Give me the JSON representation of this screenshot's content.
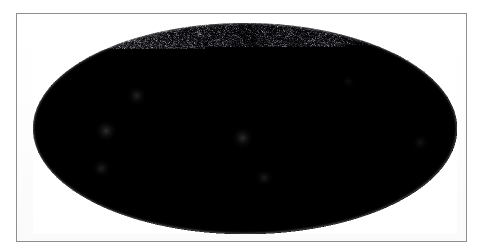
{
  "figure": {
    "title": "",
    "caption": "",
    "type": "all-sky-map",
    "projection": "Mollweide",
    "coordinate_system": "Galactic",
    "border_color": "#8e8e90",
    "page_background": "#ffffff",
    "frame_background": "#ffffff"
  },
  "skymap": {
    "name": "all-sky-galaxy-density-map",
    "shape": "ellipse",
    "center_x": 244,
    "center_y": 128,
    "semi_axis_x": 212,
    "semi_axis_y": 105,
    "background_color": "#000000",
    "speckle_color_dim": "#2a2a2c",
    "speckle_color_mid": "#8a8a8e",
    "speckle_color_bright": "#e8e8ef",
    "filament_color": "#b9b9c4",
    "galactic_plane_mask_color": "#050506",
    "label": "",
    "axes_visible": false,
    "gridlines_visible": false,
    "colorbar_visible": false,
    "legend_visible": false,
    "tick_labels": []
  },
  "chart_data": {
    "type": "heatmap",
    "title": "",
    "xlabel": "",
    "ylabel": "",
    "projection": "Mollweide",
    "grid": false,
    "legend": false,
    "colorbar": false,
    "xlim": [
      180,
      -180
    ],
    "ylim": [
      -90,
      90
    ],
    "structures": [
      {
        "name": "bright-cluster-left",
        "l": 118,
        "b": -2,
        "intensity": 0.92
      },
      {
        "name": "bright-cluster-left-upper",
        "l": 96,
        "b": 28,
        "intensity": 0.74
      },
      {
        "name": "filament-lower-left",
        "l": 130,
        "b": -34,
        "intensity": 0.66
      },
      {
        "name": "central-filament-knot",
        "l": 2,
        "b": -8,
        "intensity": 0.88
      },
      {
        "name": "galactic-plane-mask",
        "l": 0,
        "b": 0,
        "intensity": 0.05
      },
      {
        "name": "filament-lower-centre",
        "l": -18,
        "b": -42,
        "intensity": 0.58
      },
      {
        "name": "diffuse-region-upper-right",
        "l": -96,
        "b": 40,
        "intensity": 0.28
      },
      {
        "name": "filament-right-edge",
        "l": -150,
        "b": -12,
        "intensity": 0.45
      }
    ]
  }
}
